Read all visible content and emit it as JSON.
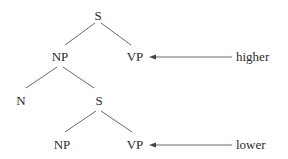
{
  "diagram": {
    "type": "syntax-tree",
    "nodes": {
      "s_top": "S",
      "np_top": "NP",
      "vp_top": "VP",
      "n": "N",
      "s_lower": "S",
      "np_lower": "NP",
      "vp_lower": "VP"
    },
    "edges": [
      [
        "S",
        "NP"
      ],
      [
        "S",
        "VP"
      ],
      [
        "NP",
        "N"
      ],
      [
        "NP",
        "S"
      ],
      [
        "S",
        "NP"
      ],
      [
        "S",
        "VP"
      ]
    ],
    "annotations": {
      "higher": "higher",
      "lower": "lower"
    },
    "colors": {
      "text": "#2b2b2b",
      "lines": "#555555",
      "background": "#ffffff"
    }
  }
}
